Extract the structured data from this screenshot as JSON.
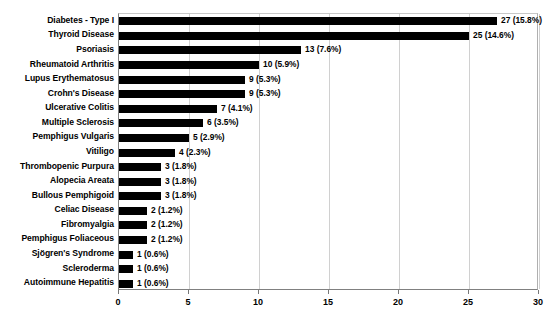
{
  "chart_data": {
    "type": "bar",
    "orientation": "horizontal",
    "title": "",
    "xlabel": "",
    "ylabel": "",
    "xlim": [
      0,
      30
    ],
    "xticks": [
      0,
      5,
      10,
      15,
      20,
      25,
      30
    ],
    "grid": true,
    "legend": null,
    "bar_color": "#000000",
    "categories": [
      "Diabetes - Type I",
      "Thyroid Disease",
      "Psoriasis",
      "Rheumatoid Arthritis",
      "Lupus Erythematosus",
      "Crohn's Disease",
      "Ulcerative Colitis",
      "Multiple Sclerosis",
      "Pemphigus Vulgaris",
      "Vitiligo",
      "Thrombopenic Purpura",
      "Alopecia Areata",
      "Bullous Pemphigoid",
      "Celiac Disease",
      "Fibromyalgia",
      "Pemphigus Foliaceous",
      "Sjögren's Syndrome",
      "Scleroderma",
      "Autoimmune Hepatitis"
    ],
    "values": [
      27,
      25,
      13,
      10,
      9,
      9,
      7,
      6,
      5,
      4,
      3,
      3,
      3,
      2,
      2,
      2,
      1,
      1,
      1
    ],
    "percents": [
      15.8,
      14.6,
      7.6,
      5.9,
      5.3,
      5.3,
      4.1,
      3.5,
      2.9,
      2.3,
      1.8,
      1.8,
      1.8,
      1.2,
      1.2,
      1.2,
      0.6,
      0.6,
      0.6
    ],
    "data_labels": [
      "27 (15.8%)",
      "25 (14.6%)",
      "13 (7.6%)",
      "10 (5.9%)",
      "9 (5.3%)",
      "9 (5.3%)",
      "7 (4.1%)",
      "6 (3.5%)",
      "5 (2.9%)",
      "4 (2.3%)",
      "3 (1.8%)",
      "3 (1.8%)",
      "3 (1.8%)",
      "2 (1.2%)",
      "2 (1.2%)",
      "2 (1.2%)",
      "1 (0.6%)",
      "1 (0.6%)",
      "1 (0.6%)"
    ],
    "xtick_labels": [
      "0",
      "5",
      "10",
      "15",
      "20",
      "25",
      "30"
    ]
  }
}
